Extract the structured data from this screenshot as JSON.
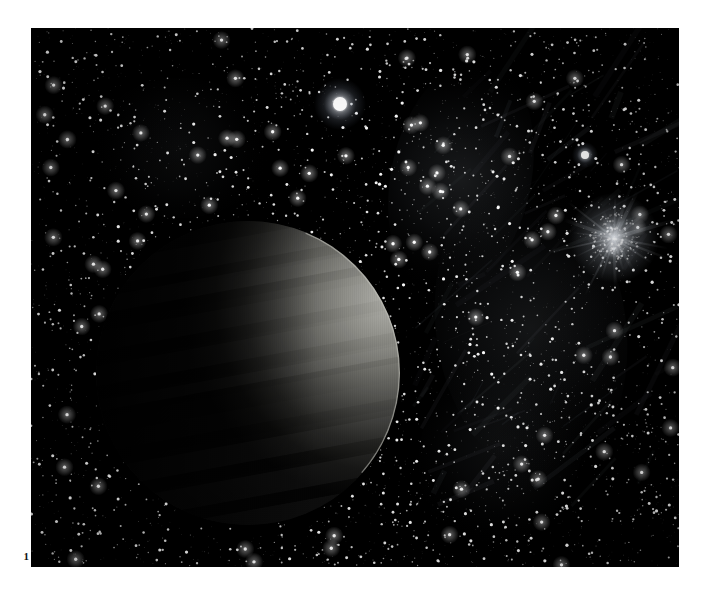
{
  "figure": {
    "number_label": "1",
    "caption": "",
    "background_color": "#ffffff",
    "plate_background_color": "#000000",
    "plate": {
      "x": 31,
      "y": 28,
      "width": 648,
      "height": 539
    }
  },
  "scene": {
    "title": "Crescent-lit planet against a dense star field",
    "description": "A large dark planetary disc, lit as a thin crescent along its upper-right limb, set against a dense field of stars with faint nebulosity, a bright foreground star, a secondary star, and a diffuse globular cluster."
  },
  "objects": {
    "planet": {
      "name": "planet-disc",
      "center_x": 217,
      "center_y": 345,
      "radius": 152,
      "shadow_color": "#050505",
      "limb_color": "#7b7a76",
      "terminator_color": "#1a1a19",
      "illumination_angle_deg": 28,
      "crescent_fraction": 0.22,
      "band_count": 9
    },
    "bright_star": {
      "name": "bright-star",
      "x": 309,
      "y": 76,
      "core_radius": 7,
      "halo_radius": 26,
      "color": "#ffffff",
      "halo_color": "#c9d4e6"
    },
    "secondary_star": {
      "name": "secondary-star",
      "x": 554,
      "y": 127,
      "core_radius": 4,
      "halo_radius": 13,
      "color": "#ffffff",
      "halo_color": "#b9c4d8"
    },
    "cluster": {
      "name": "globular-cluster",
      "x": 583,
      "y": 210,
      "core_radius": 17,
      "halo_radius": 45,
      "color": "#dfe4ea",
      "spike_count": 22
    },
    "nebulosity": [
      {
        "name": "nebula-band-upper",
        "x": 430,
        "y": 150,
        "rx": 70,
        "ry": 120,
        "opacity": 0.16,
        "rotation": 12
      },
      {
        "name": "nebula-band-mid",
        "x": 500,
        "y": 300,
        "rx": 95,
        "ry": 150,
        "opacity": 0.13,
        "rotation": -8
      },
      {
        "name": "nebula-band-lower",
        "x": 470,
        "y": 420,
        "rx": 80,
        "ry": 100,
        "opacity": 0.09,
        "rotation": 20
      },
      {
        "name": "nebula-band-left",
        "x": 150,
        "y": 120,
        "rx": 90,
        "ry": 70,
        "opacity": 0.07,
        "rotation": 0
      }
    ],
    "starfield": {
      "name": "starfield",
      "star_count": 5200,
      "min_radius": 0.35,
      "max_radius": 1.7,
      "base_color": "#ffffff",
      "density_note": "dense uniform scatter, slightly denser toward right of frame"
    }
  },
  "colors": {
    "page_background": "#ffffff",
    "sky_black": "#000000",
    "star_white": "#ffffff",
    "planet_limb_gray": "#7b7a76",
    "nebula_gray": "#9aa3ad"
  }
}
